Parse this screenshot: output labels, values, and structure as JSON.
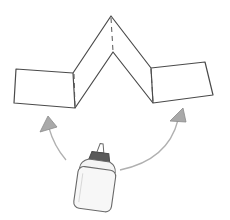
{
  "figure": {
    "colors": {
      "line": "#4a4a4a",
      "fold": "#555555",
      "arrow": "#b0b0b0",
      "arrowhead_fill": "#a9a9a9",
      "bottle_outline": "#6a6a6a",
      "bottle_cap": "#5a5a5a",
      "background": "#ffffff"
    },
    "paper": {
      "left_panel": [
        [
          16,
          69
        ],
        [
          73,
          73
        ],
        [
          75,
          108
        ],
        [
          14,
          103
        ]
      ],
      "outer_zigzag": [
        [
          73,
          73
        ],
        [
          111,
          16
        ],
        [
          151,
          68
        ]
      ],
      "inner_zigzag": [
        [
          75,
          108
        ],
        [
          113,
          52
        ],
        [
          153,
          103
        ]
      ],
      "fold_lines": [
        [
          [
            74,
            73
          ],
          [
            75,
            107
          ]
        ],
        [
          [
            111,
            17
          ],
          [
            113,
            51
          ]
        ],
        [
          [
            151,
            68
          ],
          [
            153,
            102
          ]
        ]
      ],
      "right_panel": [
        [
          151,
          68
        ],
        [
          205,
          62
        ],
        [
          213,
          95
        ],
        [
          153,
          103
        ]
      ]
    },
    "arrows": [
      {
        "name": "left-arrow",
        "path": "M66 160 Q54 146 48 128",
        "head": [
          [
            40,
            132
          ],
          [
            57,
            127
          ],
          [
            48,
            116
          ]
        ]
      },
      {
        "name": "right-arrow",
        "path": "M120 170 Q168 160 178 118",
        "head": [
          [
            170,
            120
          ],
          [
            186,
            121
          ],
          [
            183,
            108
          ]
        ]
      }
    ]
  }
}
